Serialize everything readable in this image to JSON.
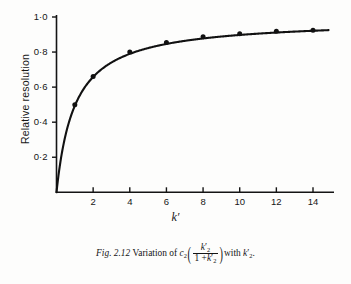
{
  "figure": {
    "caption_figure_number": "Fig. 2.12",
    "caption_lead": "Variation of",
    "caption_function_symbol": "c",
    "caption_function_subscript": "2",
    "caption_numerator_var": "k",
    "caption_numerator_prime": "′",
    "caption_numerator_sub": "2",
    "caption_denominator_one": "1 +",
    "caption_denominator_var": "k",
    "caption_denominator_prime": "′",
    "caption_denominator_sub": "2",
    "caption_with": "with",
    "caption_tail_var": "k",
    "caption_tail_prime": "′",
    "caption_tail_sub": "2",
    "caption_period": "."
  },
  "chart_data": {
    "type": "line",
    "title": "",
    "xlabel": "k′",
    "ylabel": "Relative resolution",
    "xlim": [
      0,
      15
    ],
    "ylim": [
      0,
      1.04
    ],
    "grid": false,
    "legend": "none",
    "marker": "filled-circle",
    "line_color": "#111111",
    "marker_color": "#111111",
    "x_tick_labels": [
      "2",
      "4",
      "6",
      "8",
      "10",
      "12",
      "14"
    ],
    "x_tick_values": [
      2,
      4,
      6,
      8,
      10,
      12,
      14
    ],
    "y_tick_labels": [
      "0·2",
      "0·4",
      "0·6",
      "0·8",
      "1·0"
    ],
    "y_tick_values": [
      0.2,
      0.4,
      0.6,
      0.8,
      1.0
    ],
    "series": [
      {
        "name": "c₂(k′₂/(1+k′₂))",
        "x": [
          1,
          2,
          4,
          6,
          8,
          10,
          12,
          14
        ],
        "values": [
          0.5,
          0.66,
          0.8,
          0.855,
          0.888,
          0.905,
          0.918,
          0.925
        ]
      }
    ],
    "curve": {
      "description": "k′/(1 + k′) rising steeply from origin then flattening",
      "x_start": 0,
      "x_end": 14.85
    },
    "annotations": []
  }
}
